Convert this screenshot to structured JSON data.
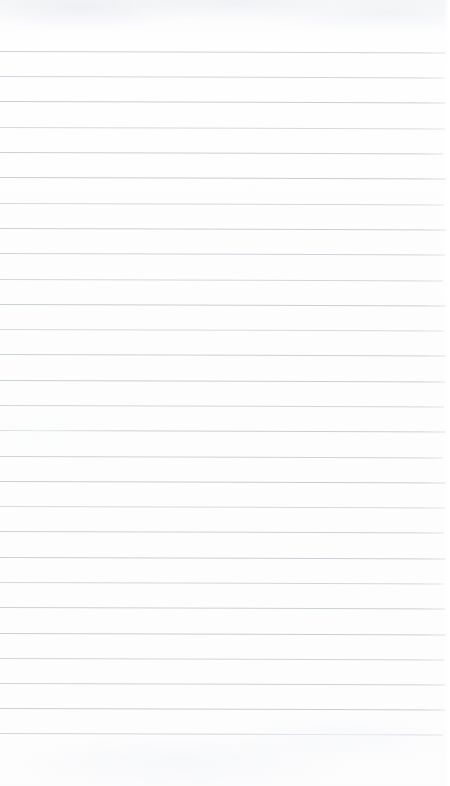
{
  "document": {
    "kind": "ruled-paper-scan",
    "title": "Blank ruled notebook page",
    "content_text": "",
    "has_handwriting": false,
    "has_print_text": false,
    "page_number_text": ""
  },
  "canvas": {
    "width": 450,
    "height": 786
  },
  "colors": {
    "page_background": "#fdfdfe",
    "paper_top_tint": "#f7f8fa",
    "rule_line": "#c6cbcf",
    "rule_line_faint": "#d8dcdf",
    "outer_background": "#ffffff"
  },
  "ruling": {
    "style": "wide-ruled horizontal lines",
    "line_count": 28,
    "first_line_y": 51,
    "last_line_y": 733,
    "line_spacing": 25.3,
    "line_thickness": 1,
    "left_inset": 0,
    "right_extent": 446,
    "skew_degrees": 0.18,
    "has_vertical_margin_rule": false,
    "margin_top": 50,
    "margin_bottom": 52,
    "line_positions": [
      51,
      76,
      101,
      127,
      152,
      177,
      203,
      228,
      253,
      279,
      304,
      329,
      354,
      380,
      405,
      430,
      456,
      481,
      506,
      531,
      557,
      582,
      607,
      633,
      658,
      683,
      708,
      733
    ],
    "line_widths": [
      446,
      444,
      446,
      445,
      443,
      446,
      444,
      446,
      445,
      443,
      446,
      444,
      446,
      445,
      444,
      446,
      443,
      446,
      445,
      444,
      446,
      443,
      445,
      446,
      444,
      446,
      445,
      443
    ],
    "line_opacities": [
      0.85,
      0.78,
      0.92,
      0.7,
      0.88,
      0.95,
      0.72,
      0.9,
      0.82,
      0.75,
      0.93,
      0.68,
      0.87,
      0.91,
      0.76,
      0.89,
      0.84,
      0.94,
      0.71,
      0.86,
      0.9,
      0.74,
      0.88,
      0.92,
      0.79,
      0.85,
      0.93,
      0.77
    ]
  }
}
